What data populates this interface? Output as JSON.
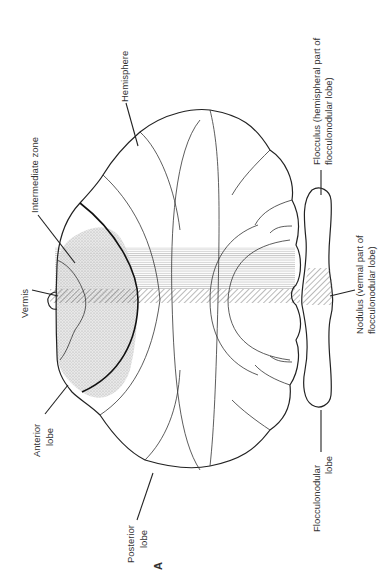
{
  "figure": {
    "panel_label": "A",
    "orientation": "rotated 90 degrees counter-clockwise"
  },
  "labels": {
    "hemisphere": "Hemisphere",
    "intermediate_zone": "Intermediate zone",
    "vermis": "Vermis",
    "anterior_lobe_1": "Anterior",
    "anterior_lobe_2": "lobe",
    "posterior_lobe_1": "Posterior",
    "posterior_lobe_2": "lobe",
    "flocculus_1": "Flocculus (hemispheral part of",
    "flocculus_2": "flocculonodular lobe)",
    "nodulus_1": "Nodulus (vermal part of",
    "nodulus_2": "flocculonodular lobe)",
    "flocculonodular_1": "Flocculonodular",
    "flocculonodular_2": "lobe"
  },
  "colors": {
    "line": "#222222",
    "text": "#333333",
    "stipple": "#d6d6d6",
    "hatch": "#7a7a7a",
    "background": "#ffffff"
  }
}
